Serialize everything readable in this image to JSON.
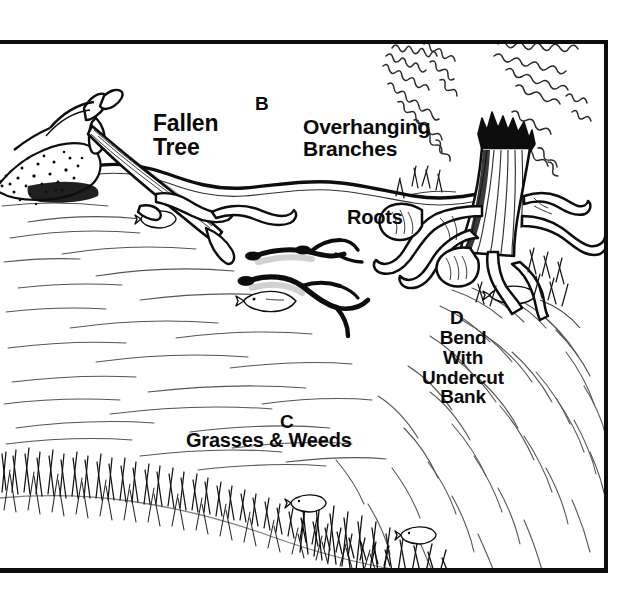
{
  "figure": {
    "style": "black-and-white pen-and-ink line illustration",
    "frame": {
      "border_color": "#0d0d0d",
      "top_rule_present": true,
      "left_edge_open": true
    }
  },
  "labels": {
    "key_b": "B",
    "fallen_tree": "Fallen\nTree",
    "overhanging_branches": "Overhanging\nBranches",
    "roots": "Roots",
    "key_d": "D",
    "bend_undercut_bank": "Bend\nWith\nUndercut\nBank",
    "key_c": "C",
    "grasses_weeds": "Grasses & Weeds"
  },
  "scene_elements": {
    "fallen_tree": "fallen-tree-illustration",
    "overhanging_branches": "overhanging-branches-illustration",
    "tree_stump_roots": "tree-stump-roots-illustration",
    "submerged_branches": "submerged-branches-illustration",
    "grass_bank": "grass-bank-illustration",
    "water_current": "water-current-lines",
    "fish": "fish-illustration",
    "bank_edge": "bank-edge-line"
  },
  "colors": {
    "ink": "#0d0d0d",
    "paper": "#ffffff",
    "light_ink": "#555555"
  }
}
